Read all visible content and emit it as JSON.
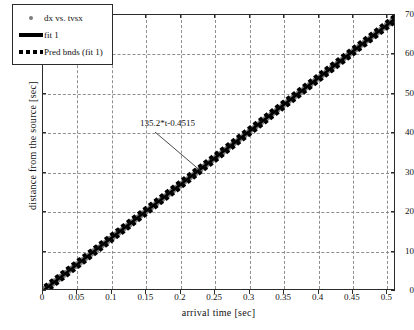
{
  "chart_data": {
    "type": "scatter",
    "title": "",
    "xlabel": "arrival time [sec]",
    "ylabel": "distance from the source [sec]",
    "xlim": [
      0,
      0.5125
    ],
    "ylim": [
      0,
      70
    ],
    "grid": true,
    "xticks": [
      "0",
      "0.05",
      "0.1",
      "0.15",
      "0.2",
      "0.25",
      "0.3",
      "0.35",
      "0.4",
      "0.45",
      "0.5"
    ],
    "xtick_values": [
      0,
      0.05,
      0.1,
      0.15,
      0.2,
      0.25,
      0.3,
      0.35,
      0.4,
      0.45,
      0.5
    ],
    "yticks": [
      "0",
      "10",
      "20",
      "30",
      "40",
      "50",
      "60",
      "70"
    ],
    "ytick_values": [
      0,
      10,
      20,
      30,
      40,
      50,
      60,
      70
    ],
    "legend_position": "upper-left",
    "legend": [
      {
        "label": "dx vs. tvsx",
        "style": "marker",
        "color": "#7d7d7d"
      },
      {
        "label": "fit 1",
        "style": "solid-line",
        "color": "#000000"
      },
      {
        "label": "Pred bnds (fit 1)",
        "style": "dotted-line",
        "color": "#000000"
      }
    ],
    "annotations": [
      {
        "text": "135.2*t-0.4515",
        "x": 0.148,
        "y": 40.5,
        "leader_to_x": 0.224,
        "leader_to_y": 30.2
      }
    ],
    "fit": {
      "equation": "135.2*t-0.4515",
      "slope": 135.2,
      "intercept": -0.4515,
      "pred_bnd_halfwidth": 0.9
    },
    "series": [
      {
        "name": "dx vs. tvsx",
        "marker": "circle",
        "color": "#7d7d7d",
        "x": [
          0.002,
          0.006,
          0.01,
          0.014,
          0.018,
          0.022,
          0.026,
          0.03,
          0.034,
          0.038,
          0.042,
          0.046,
          0.05,
          0.054,
          0.058,
          0.062,
          0.066,
          0.07,
          0.074,
          0.078,
          0.082,
          0.086,
          0.09,
          0.094,
          0.098,
          0.102,
          0.106,
          0.11,
          0.114,
          0.118,
          0.122,
          0.126,
          0.13,
          0.134,
          0.138,
          0.142,
          0.146,
          0.15,
          0.154,
          0.158,
          0.162,
          0.166,
          0.17,
          0.174,
          0.178,
          0.182,
          0.186,
          0.19,
          0.194,
          0.198,
          0.202,
          0.206,
          0.21,
          0.214,
          0.218,
          0.222,
          0.226,
          0.23,
          0.234,
          0.238,
          0.242,
          0.246,
          0.25,
          0.254,
          0.258,
          0.262,
          0.266,
          0.27,
          0.274,
          0.278,
          0.282,
          0.286,
          0.29,
          0.294,
          0.298,
          0.302,
          0.306,
          0.31,
          0.314,
          0.318,
          0.322,
          0.326,
          0.33,
          0.334,
          0.338,
          0.342,
          0.346,
          0.35,
          0.354,
          0.358,
          0.362,
          0.366,
          0.37,
          0.374,
          0.378,
          0.382,
          0.386,
          0.39,
          0.394,
          0.398,
          0.402,
          0.406,
          0.41,
          0.414,
          0.418,
          0.422,
          0.426,
          0.43,
          0.434,
          0.438,
          0.442,
          0.446,
          0.45,
          0.454,
          0.458,
          0.462,
          0.466,
          0.47,
          0.474,
          0.478,
          0.482,
          0.486,
          0.49,
          0.494,
          0.498,
          0.502,
          0.506,
          0.51,
          0.513
        ],
        "y": [
          0.0,
          0.4,
          0.9,
          1.4,
          2.0,
          2.5,
          3.1,
          3.6,
          4.1,
          4.7,
          5.2,
          5.8,
          6.3,
          6.8,
          7.4,
          7.9,
          8.4,
          9.0,
          9.6,
          10.1,
          10.6,
          11.2,
          11.7,
          12.2,
          12.8,
          13.3,
          13.9,
          14.4,
          14.9,
          15.5,
          16.0,
          16.5,
          17.1,
          17.7,
          18.2,
          18.7,
          19.3,
          19.8,
          20.3,
          20.9,
          21.4,
          22.0,
          22.5,
          23.0,
          23.6,
          24.1,
          24.7,
          25.2,
          25.8,
          26.3,
          26.8,
          27.4,
          27.9,
          28.5,
          29.0,
          29.5,
          30.1,
          30.6,
          31.2,
          31.7,
          32.2,
          32.8,
          33.3,
          33.9,
          34.4,
          34.9,
          35.5,
          36.0,
          36.6,
          37.1,
          37.6,
          38.2,
          38.7,
          39.3,
          39.8,
          40.4,
          40.9,
          41.4,
          42.0,
          42.5,
          43.1,
          43.6,
          44.1,
          44.7,
          45.2,
          45.8,
          46.3,
          46.8,
          47.4,
          47.9,
          48.5,
          49.0,
          49.5,
          50.1,
          50.6,
          51.2,
          51.7,
          52.2,
          52.8,
          53.3,
          53.9,
          54.4,
          54.9,
          55.5,
          56.0,
          56.6,
          57.1,
          57.6,
          58.2,
          58.7,
          59.3,
          59.8,
          60.4,
          60.9,
          61.4,
          62.0,
          62.5,
          63.1,
          63.6,
          64.1,
          64.7,
          65.2,
          65.8,
          66.3,
          66.8,
          67.4,
          67.9,
          68.5,
          68.9
        ]
      }
    ]
  }
}
